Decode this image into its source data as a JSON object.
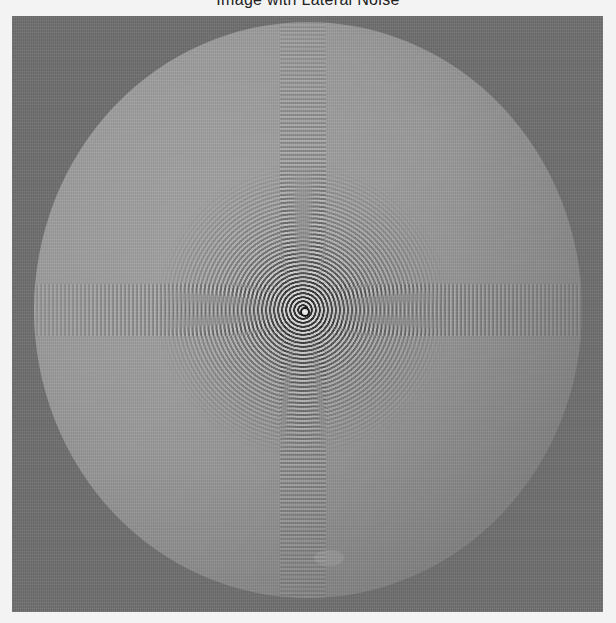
{
  "figure": {
    "title": "Image with Lateral Noise",
    "title_note": "title partially cropped at top edge",
    "image": {
      "description": "grayscale disk with concentric ring pattern and cross-shaped stripe noise",
      "colors": {
        "page_background": "#f3f3f3",
        "frame_background": "#6f6f6f",
        "disk_light": "#a3a3a3",
        "disk_dark": "#7c7c7c",
        "ring_dark": "#222222",
        "ring_light": "#e6e6e6"
      }
    }
  }
}
